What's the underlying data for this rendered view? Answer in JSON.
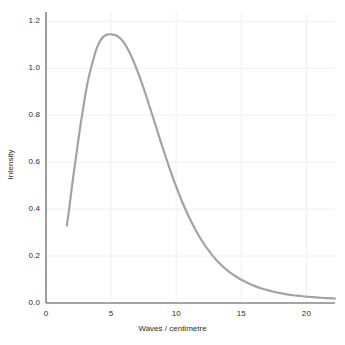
{
  "chart_data": {
    "type": "line",
    "title": "",
    "subtitle": "",
    "xlabel": "Waves / centimetre",
    "ylabel": "Intensity",
    "xlim": [
      0,
      22.2
    ],
    "ylim": [
      0,
      1.24
    ],
    "xticks": [
      0,
      5,
      10,
      15,
      20
    ],
    "xtick_labels": [
      "0",
      "5",
      "10",
      "15",
      "20"
    ],
    "yticks": [
      0.0,
      0.2,
      0.4,
      0.6,
      0.8,
      1.0,
      1.2
    ],
    "ytick_labels": [
      "0.0",
      "0.2",
      "0.4",
      "0.6",
      "0.8",
      "1.0",
      "1.2"
    ],
    "grid": true,
    "grid_axes": "both",
    "legend": null,
    "legend_position": "none",
    "annotations": [],
    "series": [
      {
        "name": "Intensity",
        "color": "#a3a3a3",
        "line_width": 2.2,
        "peak_x": 5.4,
        "peak_y": 1.14,
        "x": [
          1.6,
          1.8,
          2.0,
          2.2,
          2.4,
          2.6,
          2.8,
          3.0,
          3.2,
          3.4,
          3.6,
          3.8,
          4.0,
          4.2,
          4.4,
          4.6,
          4.8,
          5.0,
          5.2,
          5.4,
          5.6,
          5.8,
          6.0,
          6.4,
          6.8,
          7.2,
          7.6,
          8.0,
          8.4,
          8.8,
          9.2,
          9.6,
          10.0,
          10.5,
          11.0,
          11.5,
          12.0,
          12.5,
          13.0,
          13.5,
          14.0,
          14.5,
          15.0,
          15.5,
          16.0,
          16.5,
          17.0,
          17.5,
          18.0,
          18.5,
          19.0,
          19.5,
          20.0,
          20.5,
          21.0,
          21.5,
          22.0,
          22.2
        ],
        "y": [
          0.33,
          0.41,
          0.5,
          0.58,
          0.66,
          0.74,
          0.81,
          0.88,
          0.94,
          0.99,
          1.03,
          1.07,
          1.1,
          1.12,
          1.134,
          1.142,
          1.145,
          1.145,
          1.143,
          1.14,
          1.133,
          1.122,
          1.108,
          1.07,
          1.02,
          0.962,
          0.898,
          0.83,
          0.76,
          0.69,
          0.622,
          0.557,
          0.496,
          0.426,
          0.364,
          0.31,
          0.263,
          0.223,
          0.189,
          0.16,
          0.136,
          0.116,
          0.099,
          0.085,
          0.073,
          0.063,
          0.055,
          0.048,
          0.042,
          0.037,
          0.033,
          0.03,
          0.027,
          0.025,
          0.023,
          0.021,
          0.02,
          0.019
        ]
      }
    ]
  },
  "style": {
    "background": "#ffffff",
    "grid_color": "#f0f0f0",
    "spine_color": "#4d4d4d",
    "tick_text_color": "#2b2b2b",
    "curve_color": "#a3a3a3"
  }
}
